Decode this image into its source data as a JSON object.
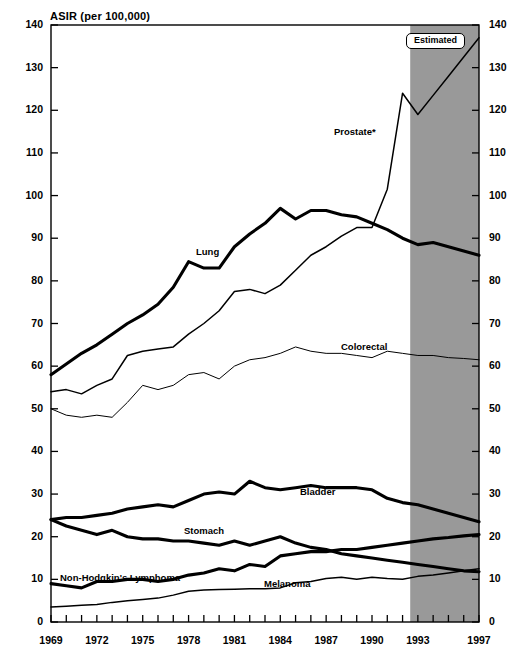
{
  "chart_data": {
    "type": "line",
    "title": "ASIR (per 100,000)",
    "xlabel": "",
    "ylabel": "ASIR (per 100,000)",
    "ylim": [
      0,
      140
    ],
    "ytick_step": 10,
    "yticks": [
      "0",
      "10",
      "20",
      "30",
      "40",
      "50",
      "60",
      "70",
      "80",
      "90",
      "100",
      "110",
      "120",
      "130",
      "140"
    ],
    "xlim": [
      1969,
      1997
    ],
    "x": [
      1969,
      1970,
      1971,
      1972,
      1973,
      1974,
      1975,
      1976,
      1977,
      1978,
      1979,
      1980,
      1981,
      1982,
      1983,
      1984,
      1985,
      1986,
      1987,
      1988,
      1989,
      1990,
      1991,
      1992,
      1993,
      1994,
      1995,
      1996,
      1997
    ],
    "xticks": [
      "1969",
      "1972",
      "1975",
      "1978",
      "1981",
      "1984",
      "1987",
      "1990",
      "1993",
      "1997"
    ],
    "xtick_values": [
      1969,
      1972,
      1975,
      1978,
      1981,
      1984,
      1987,
      1990,
      1993,
      1997
    ],
    "grid": false,
    "legend": "inline-labels",
    "annotations": [
      {
        "name": "estimated-region",
        "label": "Estimated",
        "x_start": 1992.5,
        "x_end": 1997,
        "shading": "#999999"
      }
    ],
    "series": [
      {
        "name": "Prostate*",
        "label": "Prostate*",
        "style": "thin",
        "values": [
          54.0,
          54.5,
          53.5,
          55.5,
          57.0,
          62.5,
          63.5,
          64.0,
          64.5,
          67.5,
          70.0,
          73.0,
          77.5,
          78.0,
          77.0,
          79.0,
          82.5,
          86.0,
          88.0,
          90.5,
          92.5,
          92.5,
          101.5,
          124.0,
          119.0,
          123.5,
          128.0,
          132.5,
          137.0
        ]
      },
      {
        "name": "Lung",
        "label": "Lung",
        "style": "thick",
        "values": [
          58.0,
          60.5,
          63.0,
          65.0,
          67.5,
          70.0,
          72.0,
          74.5,
          78.5,
          84.5,
          83.0,
          83.0,
          88.0,
          91.0,
          93.5,
          97.0,
          94.5,
          96.5,
          96.5,
          95.5,
          95.0,
          93.5,
          92.0,
          90.0,
          88.5,
          89.0,
          88.0,
          87.0,
          86.0
        ]
      },
      {
        "name": "Colorectal",
        "label": "Colorectal",
        "style": "hairline",
        "values": [
          50.0,
          48.5,
          48.0,
          48.5,
          48.0,
          51.5,
          55.5,
          54.5,
          55.5,
          58.0,
          58.5,
          57.0,
          60.0,
          61.5,
          62.0,
          63.0,
          64.5,
          63.5,
          63.0,
          63.0,
          62.5,
          62.0,
          63.5,
          63.0,
          62.5,
          62.5,
          62.0,
          61.8,
          61.5
        ]
      },
      {
        "name": "Bladder",
        "label": "Bladder",
        "style": "thick",
        "values": [
          24.0,
          24.5,
          24.5,
          25.0,
          25.5,
          26.5,
          27.0,
          27.5,
          27.0,
          28.5,
          30.0,
          30.5,
          30.0,
          33.0,
          31.5,
          31.0,
          31.5,
          32.0,
          31.5,
          31.5,
          31.5,
          31.0,
          29.0,
          28.0,
          27.5,
          26.5,
          25.5,
          24.5,
          23.5
        ]
      },
      {
        "name": "Stomach",
        "label": "Stomach",
        "style": "thick",
        "values": [
          24.0,
          22.5,
          21.5,
          20.5,
          21.5,
          20.0,
          19.5,
          19.5,
          19.0,
          19.0,
          18.5,
          18.0,
          19.0,
          18.0,
          19.0,
          20.0,
          18.5,
          17.5,
          17.0,
          16.0,
          15.5,
          15.0,
          14.5,
          14.0,
          13.5,
          13.0,
          12.5,
          12.0,
          11.8
        ]
      },
      {
        "name": "Non-Hodgkin's Lymphoma",
        "label": "Non-Hodgkin's Lymphoma",
        "style": "thick",
        "values": [
          9.0,
          8.5,
          8.0,
          9.5,
          9.5,
          10.0,
          10.0,
          9.5,
          10.0,
          11.0,
          11.5,
          12.5,
          12.0,
          13.5,
          13.0,
          15.5,
          16.0,
          16.5,
          16.5,
          17.0,
          17.0,
          17.5,
          18.0,
          18.5,
          19.0,
          19.5,
          19.8,
          20.2,
          20.5
        ]
      },
      {
        "name": "Melanoma",
        "label": "Melanoma",
        "style": "thin",
        "values": [
          3.5,
          3.7,
          3.9,
          4.1,
          4.6,
          5.0,
          5.3,
          5.6,
          6.3,
          7.2,
          7.5,
          7.6,
          7.7,
          7.8,
          7.8,
          8.0,
          9.2,
          9.5,
          10.2,
          10.5,
          10.0,
          10.5,
          10.2,
          10.0,
          10.7,
          11.0,
          11.5,
          12.0,
          12.5
        ]
      }
    ],
    "series_label_positions": [
      {
        "series": "Prostate*",
        "x_px": 334,
        "y_px": 126
      },
      {
        "series": "Lung",
        "x_px": 196,
        "y_px": 246
      },
      {
        "series": "Colorectal",
        "x_px": 341,
        "y_px": 341
      },
      {
        "series": "Bladder",
        "x_px": 300,
        "y_px": 486
      },
      {
        "series": "Stomach",
        "x_px": 184,
        "y_px": 525
      },
      {
        "series": "Non-Hodgkin's Lymphoma",
        "x_px": 60,
        "y_px": 572
      },
      {
        "series": "Melanoma",
        "x_px": 264,
        "y_px": 578
      }
    ],
    "colors": {
      "line": "#000000",
      "axis": "#000000",
      "estimated_shading": "#999999",
      "background": "#ffffff"
    }
  }
}
